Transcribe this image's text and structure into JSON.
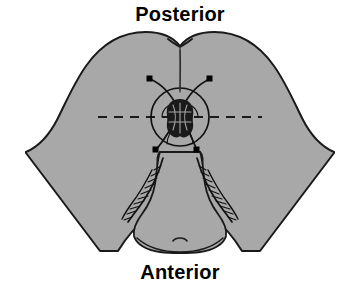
{
  "figure": {
    "background_color": "#ffffff",
    "width": 360,
    "height": 291
  },
  "labels": {
    "posterior": "Posterior",
    "anterior": "Anterior"
  },
  "colors": {
    "skin_fill": "#a8a8a8",
    "outline": "#1a1a1a",
    "detail_line": "#111111",
    "marker_fill": "#000000",
    "label_text": "#000000",
    "background": "#ffffff"
  },
  "anatomy": {
    "buttocks": {
      "name": "buttocks-silhouette",
      "fill": "#a8a8a8",
      "stroke": "#1a1a1a",
      "stroke_width": 2
    },
    "gluteal_cleft": {
      "name": "gluteal-cleft-notch",
      "description": "V notch at superior midline with vertical descending line"
    },
    "anus": {
      "name": "anal-orifice",
      "description": "irregular dark radiating blob at center of circle",
      "center_x": 180,
      "center_y": 117
    },
    "perineal_body": {
      "name": "perineal-body",
      "description": "bell shaped region inferior to anus with feathered hatching both sides"
    }
  },
  "markings": {
    "circle": {
      "name": "anal-margin-circle",
      "center_x": 180,
      "center_y": 117,
      "radius": 29,
      "stroke_width": 1.6
    },
    "dashed_axis": {
      "name": "transverse-dashed-axis",
      "orientation": "horizontal",
      "y": 117,
      "x_start": 98,
      "x_end": 262,
      "dash_pattern": "9 7"
    },
    "midline": {
      "name": "posterior-midline-guide",
      "orientation": "vertical",
      "x": 180,
      "y_start": 42,
      "y_end": 92
    },
    "anchor_points": [
      {
        "name": "marker-posterior-left",
        "x": 150,
        "y": 79,
        "size": 5
      },
      {
        "name": "marker-posterior-right",
        "x": 210,
        "y": 79,
        "size": 5
      },
      {
        "name": "marker-anterior-left",
        "x": 156,
        "y": 150,
        "size": 5
      },
      {
        "name": "marker-anterior-right",
        "x": 197,
        "y": 150,
        "size": 5
      }
    ],
    "crossing_curves": [
      {
        "name": "curve-posterior-left-to-anterior-right"
      },
      {
        "name": "curve-posterior-right-to-anterior-left"
      }
    ]
  }
}
